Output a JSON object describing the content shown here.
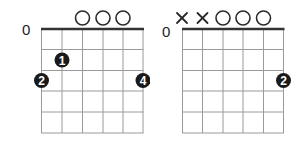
{
  "colors": {
    "grid": "#9a9a9a",
    "nut": "#333333",
    "dot": "#1a1a1a",
    "dot_text": "#ffffff",
    "marker": "#2a2a2a"
  },
  "chords": [
    {
      "fret_label": "0",
      "strings": 6,
      "frets": 5,
      "markers": [
        "",
        "",
        "",
        "O",
        "O",
        "O"
      ],
      "fingers": [
        {
          "string": 2,
          "fret_pos": 1.5,
          "label": "1"
        },
        {
          "string": 1,
          "fret_pos": 2.5,
          "label": "2"
        },
        {
          "string": 6,
          "fret_pos": 2.5,
          "label": "4"
        }
      ]
    },
    {
      "fret_label": "0",
      "strings": 6,
      "frets": 5,
      "markers": [
        "X",
        "X",
        "O",
        "O",
        "O",
        ""
      ],
      "fingers": [
        {
          "string": 6,
          "fret_pos": 2.5,
          "label": "2"
        }
      ]
    }
  ]
}
